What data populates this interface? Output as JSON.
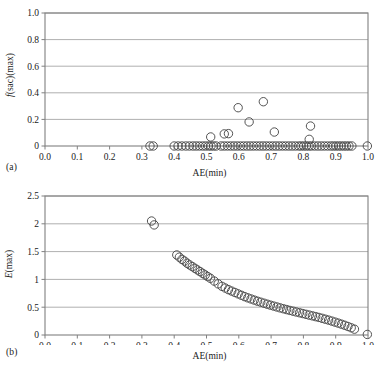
{
  "figure": {
    "background": "#ffffff",
    "marker_color": "#4a4a4a",
    "frame_color": "#808080",
    "grid_color": "#9a9a9a"
  },
  "panels": [
    {
      "id": "a",
      "label": "(a)",
      "xlabel": "AE(min)",
      "ylabel_plain": "f(sac)(max)",
      "xticks": [
        "0.0",
        "0.1",
        "0.2",
        "0.3",
        "0.4",
        "0.5",
        "0.6",
        "0.7",
        "0.8",
        "0.9",
        "1.0"
      ],
      "yticks": [
        "0",
        "0.2",
        "0.4",
        "0.6",
        "0.8",
        "1.0"
      ]
    },
    {
      "id": "b",
      "label": "(b)",
      "xlabel": "AE(min)",
      "ylabel_plain": "E(max)",
      "xticks": [
        "0.0",
        "0.1",
        "0.2",
        "0.3",
        "0.4",
        "0.5",
        "0.6",
        "0.7",
        "0.8",
        "0.9",
        "1.0"
      ],
      "yticks": [
        "0",
        "0.5",
        "1",
        "1.5",
        "2",
        "2.5"
      ]
    }
  ],
  "chart_data": [
    {
      "type": "scatter",
      "panel": "a",
      "title": "",
      "xlabel": "AE(min)",
      "ylabel": "f(sac)(max)",
      "xlim": [
        0.0,
        1.0
      ],
      "ylim": [
        0.0,
        1.0
      ],
      "xticks": [
        0.0,
        0.1,
        0.2,
        0.3,
        0.4,
        0.5,
        0.6,
        0.7,
        0.8,
        0.9,
        1.0
      ],
      "yticks": [
        0.0,
        0.2,
        0.4,
        0.6,
        0.8,
        1.0
      ],
      "grid": "horizontal",
      "legend": "none",
      "marker": "open-circle",
      "x": [
        0.325,
        0.335,
        0.4,
        0.412,
        0.424,
        0.436,
        0.447,
        0.458,
        0.468,
        0.478,
        0.488,
        0.497,
        0.506,
        0.514,
        0.522,
        0.53,
        0.545,
        0.555,
        0.565,
        0.575,
        0.585,
        0.595,
        0.605,
        0.615,
        0.625,
        0.635,
        0.645,
        0.655,
        0.665,
        0.675,
        0.685,
        0.695,
        0.705,
        0.715,
        0.725,
        0.735,
        0.745,
        0.755,
        0.765,
        0.775,
        0.785,
        0.793,
        0.801,
        0.809,
        0.817,
        0.825,
        0.835,
        0.845,
        0.855,
        0.865,
        0.875,
        0.885,
        0.893,
        0.901,
        0.909,
        0.917,
        0.925,
        0.933,
        0.941,
        0.95,
        0.998,
        0.513,
        0.555,
        0.568,
        0.598,
        0.632,
        0.676,
        0.71,
        0.818,
        0.822
      ],
      "y": [
        0.0,
        0.0,
        0.0,
        0.0,
        0.0,
        0.0,
        0.0,
        0.0,
        0.0,
        0.0,
        0.0,
        0.0,
        0.0,
        0.0,
        0.0,
        0.0,
        0.0,
        0.0,
        0.0,
        0.0,
        0.0,
        0.0,
        0.0,
        0.0,
        0.0,
        0.0,
        0.0,
        0.0,
        0.0,
        0.0,
        0.0,
        0.0,
        0.0,
        0.0,
        0.0,
        0.0,
        0.0,
        0.0,
        0.0,
        0.0,
        0.0,
        0.0,
        0.0,
        0.0,
        0.0,
        0.0,
        0.0,
        0.0,
        0.0,
        0.0,
        0.0,
        0.0,
        0.0,
        0.0,
        0.0,
        0.0,
        0.0,
        0.0,
        0.0,
        0.0,
        0.0,
        0.068,
        0.091,
        0.093,
        0.288,
        0.181,
        0.333,
        0.105,
        0.05,
        0.15
      ]
    },
    {
      "type": "scatter",
      "panel": "b",
      "title": "",
      "xlabel": "AE(min)",
      "ylabel": "E(max)",
      "xlim": [
        0.0,
        1.0
      ],
      "ylim": [
        0.0,
        2.5
      ],
      "xticks": [
        0.0,
        0.1,
        0.2,
        0.3,
        0.4,
        0.5,
        0.6,
        0.7,
        0.8,
        0.9,
        1.0
      ],
      "yticks": [
        0.0,
        0.5,
        1.0,
        1.5,
        2.0,
        2.5
      ],
      "grid": "horizontal",
      "legend": "none",
      "marker": "open-circle",
      "x": [
        0.33,
        0.338,
        0.408,
        0.416,
        0.424,
        0.432,
        0.44,
        0.448,
        0.456,
        0.464,
        0.472,
        0.48,
        0.488,
        0.496,
        0.504,
        0.512,
        0.524,
        0.536,
        0.548,
        0.558,
        0.568,
        0.578,
        0.588,
        0.598,
        0.608,
        0.618,
        0.628,
        0.638,
        0.648,
        0.658,
        0.668,
        0.678,
        0.688,
        0.698,
        0.708,
        0.718,
        0.728,
        0.738,
        0.748,
        0.758,
        0.768,
        0.778,
        0.788,
        0.798,
        0.808,
        0.818,
        0.828,
        0.838,
        0.848,
        0.858,
        0.868,
        0.878,
        0.888,
        0.898,
        0.908,
        0.918,
        0.928,
        0.938,
        0.948,
        0.958,
        0.998
      ],
      "y": [
        2.05,
        1.98,
        1.44,
        1.4,
        1.36,
        1.33,
        1.29,
        1.26,
        1.23,
        1.2,
        1.17,
        1.14,
        1.11,
        1.08,
        1.05,
        1.02,
        0.97,
        0.92,
        0.875,
        0.845,
        0.815,
        0.79,
        0.765,
        0.74,
        0.715,
        0.69,
        0.668,
        0.648,
        0.628,
        0.608,
        0.59,
        0.572,
        0.554,
        0.537,
        0.52,
        0.504,
        0.488,
        0.472,
        0.457,
        0.442,
        0.428,
        0.414,
        0.4,
        0.386,
        0.372,
        0.358,
        0.344,
        0.33,
        0.316,
        0.3,
        0.284,
        0.268,
        0.25,
        0.232,
        0.214,
        0.195,
        0.175,
        0.153,
        0.13,
        0.105,
        0.01
      ]
    }
  ]
}
